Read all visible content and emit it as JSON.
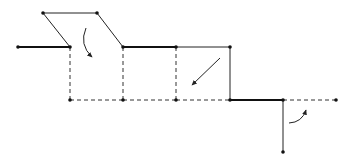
{
  "diagram": {
    "colors": {
      "stroke": "#111111",
      "background": "#ffffff"
    },
    "points": [
      {
        "id": "p1",
        "x": 18,
        "y": 47
      },
      {
        "id": "p2",
        "x": 70,
        "y": 47
      },
      {
        "id": "p3",
        "x": 43,
        "y": 13
      },
      {
        "id": "p4",
        "x": 97,
        "y": 13
      },
      {
        "id": "p5",
        "x": 123,
        "y": 47
      },
      {
        "id": "p6",
        "x": 176,
        "y": 47
      },
      {
        "id": "p7",
        "x": 230,
        "y": 47
      },
      {
        "id": "p8",
        "x": 70,
        "y": 100
      },
      {
        "id": "p9",
        "x": 123,
        "y": 100
      },
      {
        "id": "p10",
        "x": 176,
        "y": 100
      },
      {
        "id": "p11",
        "x": 230,
        "y": 100
      },
      {
        "id": "p12",
        "x": 283,
        "y": 100
      },
      {
        "id": "p13",
        "x": 336,
        "y": 100
      },
      {
        "id": "p14",
        "x": 283,
        "y": 152
      }
    ],
    "thick_segments": [
      {
        "from": "p1",
        "to": "p2"
      },
      {
        "from": "p5",
        "to": "p6"
      },
      {
        "from": "p11",
        "to": "p12"
      }
    ],
    "thin_segments": [
      {
        "from": "p2",
        "to": "p3"
      },
      {
        "from": "p3",
        "to": "p4"
      },
      {
        "from": "p4",
        "to": "p5"
      },
      {
        "from": "p6",
        "to": "p7"
      },
      {
        "from": "p7",
        "to": "p11"
      },
      {
        "from": "p12",
        "to": "p14"
      }
    ],
    "dashed_segments": [
      {
        "from": "p2",
        "to": "p8"
      },
      {
        "from": "p8",
        "to": "p9"
      },
      {
        "from": "p9",
        "to": "p5"
      },
      {
        "from": "p9",
        "to": "p10"
      },
      {
        "from": "p6",
        "to": "p10"
      },
      {
        "from": "p10",
        "to": "p11"
      },
      {
        "from": "p12",
        "to": "p13"
      }
    ],
    "arrows": [
      {
        "name": "rotate-down-arrow",
        "type": "curved",
        "from": [
          86,
          28
        ],
        "to": [
          92,
          57
        ]
      },
      {
        "name": "diagonal-down-left-arrow",
        "type": "straight",
        "from": [
          220,
          58
        ],
        "to": [
          192,
          85
        ]
      },
      {
        "name": "rotate-up-arrow",
        "type": "curved",
        "from": [
          289,
          123
        ],
        "to": [
          306,
          110
        ]
      }
    ]
  }
}
